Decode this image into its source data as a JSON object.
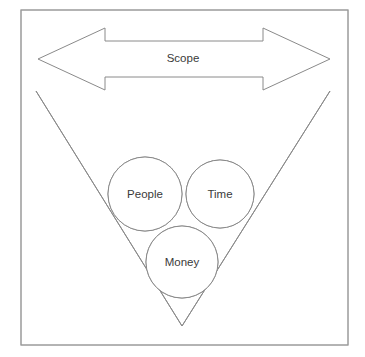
{
  "diagram": {
    "background_color": "#ffffff",
    "stroke_color": "#8a8a8a",
    "text_color": "#3a3a3a",
    "frame": {
      "name": "outer-border",
      "x": 21,
      "y": 10,
      "width": 327,
      "height": 335,
      "stroke_color": "#9a9a9a",
      "fill_color": "#ffffff"
    },
    "scope_arrow": {
      "label": "Scope",
      "label_x": 183,
      "label_y": 59,
      "tip_left_x": 38,
      "tip_right_x": 330,
      "axis_y": 59,
      "head_top_y": 28,
      "head_bottom_y": 90,
      "shaft_top_y": 41,
      "shaft_bottom_y": 77,
      "head_left_back_x": 105,
      "head_right_back_x": 263,
      "points": "38,59 105,28 105,41 263,41 263,28 330,59 263,90 263,77 105,77 105,90"
    },
    "v_shape": {
      "name": "triangle-v",
      "left_start_x": 36,
      "left_start_y": 91,
      "right_start_x": 330,
      "right_start_y": 91,
      "apex_x": 182,
      "apex_y": 326
    },
    "circles": [
      {
        "label": "People",
        "cx": 145,
        "cy": 194,
        "r": 37,
        "fill": "#ffffff",
        "stroke": "#8a8a8a"
      },
      {
        "label": "Time",
        "cx": 220,
        "cy": 194,
        "r": 34,
        "fill": "#ffffff",
        "stroke": "#8a8a8a"
      },
      {
        "label": "Money",
        "cx": 182,
        "cy": 262,
        "r": 36,
        "fill": "#ffffff",
        "stroke": "#8a8a8a"
      }
    ]
  }
}
